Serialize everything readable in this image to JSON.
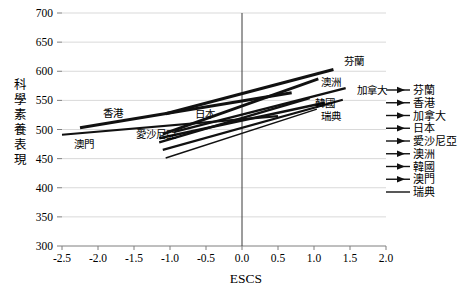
{
  "chart_data": {
    "type": "line",
    "title": "",
    "xlabel": "ESCS",
    "ylabel": "科學素養表現",
    "xlim": [
      -2.5,
      2.0
    ],
    "ylim": [
      300,
      700
    ],
    "x_ticks": [
      -2.5,
      -2.0,
      -1.5,
      -1.0,
      -0.5,
      0.0,
      0.5,
      1.0,
      1.5,
      2.0
    ],
    "x_tick_labels": [
      "-2.5",
      "-2.0",
      "-1.5",
      "-1.0",
      "-0.5",
      "0.0",
      "0.5",
      "1.0",
      "1.5",
      "2.0"
    ],
    "y_ticks": [
      300,
      350,
      400,
      450,
      500,
      550,
      600,
      650,
      700
    ],
    "y_tick_labels": [
      "300",
      "350",
      "400",
      "450",
      "500",
      "550",
      "600",
      "650",
      "700"
    ],
    "grid": "horizontal-only",
    "vertical_zero_line": true,
    "legend_position": "right",
    "colors": {
      "line": "#111111",
      "grid": "#d9d9d9",
      "axis": "#7f7f7f",
      "zero_line": "#3a3a3a",
      "text": "#000000"
    },
    "series": [
      {
        "id": "finland",
        "name": "芬蘭",
        "points": [
          [
            -1.06,
            527
          ],
          [
            1.27,
            603
          ]
        ],
        "width": 3.0,
        "label_at": [
          1.55,
          617
        ],
        "legend_arrow": true
      },
      {
        "id": "hong-kong",
        "name": "香港",
        "points": [
          [
            -2.25,
            503
          ],
          [
            0.69,
            563
          ]
        ],
        "width": 3.0,
        "label_at": [
          -1.79,
          529
        ],
        "legend_arrow": true
      },
      {
        "id": "canada",
        "name": "加拿大",
        "points": [
          [
            -0.94,
            496
          ],
          [
            1.44,
            571
          ]
        ],
        "width": 2.4,
        "label_at": [
          1.8,
          568
        ],
        "legend_arrow": true
      },
      {
        "id": "japan",
        "name": "日本",
        "points": [
          [
            -1.15,
            478
          ],
          [
            0.94,
            554
          ]
        ],
        "width": 2.4,
        "label_at": [
          -0.51,
          526
        ],
        "legend_arrow": true
      },
      {
        "id": "estonia",
        "name": "愛沙尼亞",
        "points": [
          [
            -1.15,
            485
          ],
          [
            1.15,
            546
          ]
        ],
        "width": 2.4,
        "label_at": [
          -1.19,
          492
        ],
        "legend_arrow": true
      },
      {
        "id": "australia",
        "name": "澳洲",
        "points": [
          [
            -1.1,
            492
          ],
          [
            1.06,
            587
          ]
        ],
        "width": 2.8,
        "label_at": [
          1.24,
          582
        ],
        "legend_arrow": true
      },
      {
        "id": "korea",
        "name": "韓國",
        "points": [
          [
            -1.1,
            465
          ],
          [
            1.4,
            551
          ]
        ],
        "width": 2.2,
        "label_at": [
          1.15,
          545
        ],
        "legend_arrow": true
      },
      {
        "id": "macau",
        "name": "澳門",
        "points": [
          [
            -2.5,
            491
          ],
          [
            0.5,
            523
          ]
        ],
        "width": 2.2,
        "label_at": [
          -2.19,
          475
        ],
        "legend_arrow": true
      },
      {
        "id": "sweden",
        "name": "瑞典",
        "points": [
          [
            -1.06,
            451
          ],
          [
            1.04,
            535
          ]
        ],
        "width": 1.5,
        "label_at": [
          1.24,
          523
        ],
        "legend_arrow": false
      }
    ],
    "legend_items": [
      "芬蘭",
      "香港",
      "加拿大",
      "日本",
      "愛沙尼亞",
      "澳洲",
      "韓國",
      "澳門",
      "瑞典"
    ]
  }
}
